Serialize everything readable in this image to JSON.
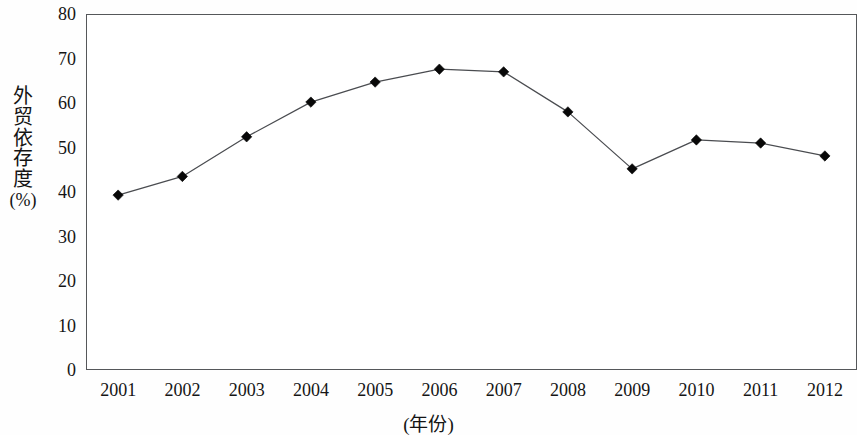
{
  "chart_data": {
    "type": "line",
    "title": "",
    "subtitle": "",
    "xlabel": "(年份)",
    "ylabel": "外贸依存度(%)",
    "ylabel_chars": [
      "外",
      "贸",
      "依",
      "存",
      "度"
    ],
    "ylabel_unit": "(%)",
    "categories": [
      "2001",
      "2002",
      "2003",
      "2004",
      "2005",
      "2006",
      "2007",
      "2008",
      "2009",
      "2010",
      "2011",
      "2012"
    ],
    "values": [
      39.3,
      43.5,
      52.4,
      60.2,
      64.7,
      67.6,
      67.0,
      58.0,
      45.2,
      51.7,
      51.0,
      48.1
    ],
    "series": [
      {
        "name": "外贸依存度",
        "values": [
          39.3,
          43.5,
          52.4,
          60.2,
          64.7,
          67.6,
          67.0,
          58.0,
          45.2,
          51.7,
          51.0,
          48.1
        ]
      }
    ],
    "ylim": [
      0,
      80
    ],
    "ytick_step": 10,
    "yticks": [
      "0",
      "10",
      "20",
      "30",
      "40",
      "50",
      "60",
      "70",
      "80"
    ],
    "ytick_values": [
      0,
      10,
      20,
      30,
      40,
      50,
      60,
      70,
      80
    ],
    "xticks": [
      "2001",
      "2002",
      "2003",
      "2004",
      "2005",
      "2006",
      "2007",
      "2008",
      "2009",
      "2010",
      "2011",
      "2012"
    ],
    "grid": false,
    "legend": false,
    "legend_position": "none",
    "marker": "diamond",
    "line_color": "#4a4c50",
    "marker_color": "#080808",
    "axis_color": "#55575a",
    "background_color": "#ffffff",
    "annotations": []
  }
}
